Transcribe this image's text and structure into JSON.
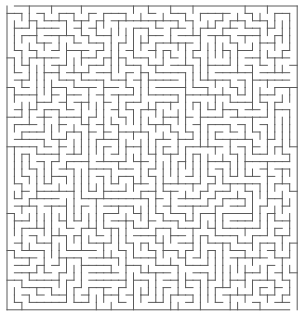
{
  "puzzle": {
    "type": "maze",
    "title": "Maze",
    "cols": 39,
    "rows": 41,
    "origin_x": 7,
    "origin_y": 6,
    "cell_w": 7.44,
    "cell_h": 7.41,
    "wall_color": "#5a5a5a",
    "wall_width": 1,
    "background": "#ffffff",
    "entrance": {
      "side": "top",
      "col": 0
    },
    "exit": {
      "side": "bottom",
      "col": 38
    },
    "seed": 1337
  }
}
